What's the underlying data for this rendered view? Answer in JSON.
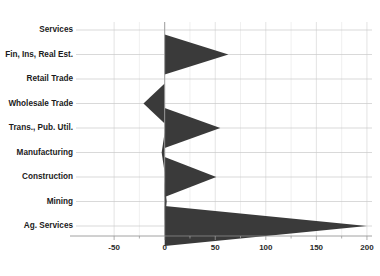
{
  "chart_data": {
    "type": "bar",
    "variant": "horizontal-wedge-kite",
    "title": "",
    "subtitle": "",
    "xlabel": "",
    "ylabel": "",
    "categories": [
      "Services",
      "Fin, Ins, Real Est.",
      "Retail Trade",
      "Wholesale Trade",
      "Trans., Pub. Util.",
      "Manufacturing",
      "Construction",
      "Mining",
      "Ag. Services"
    ],
    "values": [
      0,
      63,
      0,
      -21,
      55,
      -3,
      51,
      2,
      200
    ],
    "xlim": [
      -60,
      205
    ],
    "xticks": [
      -50,
      0,
      50,
      100,
      150,
      200
    ],
    "xticklabels": [
      "-50",
      "0",
      "50",
      "100",
      "150",
      "200"
    ],
    "minor_tick_step": 25,
    "grid": true,
    "grid_axis": "x",
    "legend": "none",
    "series": [
      {
        "name": "Change",
        "values": [
          0,
          63,
          0,
          -21,
          55,
          -3,
          51,
          2,
          200
        ]
      }
    ],
    "colors": {
      "wedge_fill": "#3a3a3a",
      "grid": "#d8d8d8",
      "axis": "#8c8c8c",
      "text": "#1b1b1b",
      "background": "#ffffff"
    }
  }
}
